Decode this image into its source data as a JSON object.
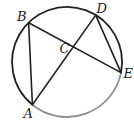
{
  "figure": {
    "type": "circle-geometry-diagram",
    "shape": "circle",
    "labels": {
      "A": "A",
      "B": "B",
      "C": "C",
      "D": "D",
      "E": "E"
    },
    "points_on_circle": [
      "A",
      "B",
      "D",
      "E"
    ],
    "chords": [
      "AB",
      "AD",
      "BE",
      "DE"
    ],
    "intersection_point": "C",
    "highlighted_arc": "AE",
    "colors": {
      "stroke": "#212121",
      "arc_highlight": "#8f8f8f",
      "label_color": "#1a1a1a",
      "background": "#ffffff"
    }
  }
}
